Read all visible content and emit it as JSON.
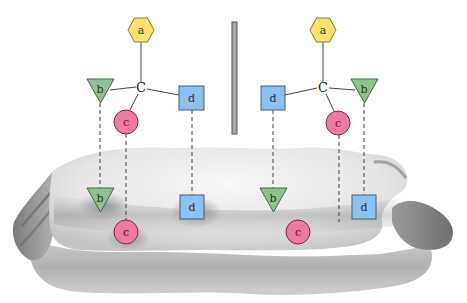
{
  "figure": {
    "divider": {
      "x": 232,
      "y": 22,
      "width": 5,
      "height": 112,
      "fill": "#a9a9ad",
      "stroke": "#555555"
    }
  },
  "colors": {
    "hexagon": "#f7e26b",
    "hexagon_stroke": "#8d7a2a",
    "triangle": "#8fc28f",
    "triangle_stroke": "#3e6b3e",
    "circle": "#ee7aa3",
    "circle_stroke": "#7c2d4a",
    "square": "#8cc1ee",
    "square_stroke": "#3a5f82",
    "surface_light": "#f2f2f2",
    "surface_dark": "#9b9b9b",
    "line": "#444444"
  },
  "left_molecule": {
    "center_label": "C",
    "a": {
      "label": "a",
      "shape": "hexagon",
      "cx": 141,
      "cy": 30
    },
    "b": {
      "label": "b",
      "shape": "triangle",
      "cx": 100,
      "cy": 89
    },
    "c": {
      "label": "c",
      "shape": "circle",
      "cx": 126,
      "cy": 122
    },
    "d": {
      "label": "d",
      "shape": "square",
      "cx": 191,
      "cy": 98
    }
  },
  "right_molecule": {
    "center_label": "C",
    "a": {
      "label": "a",
      "shape": "hexagon",
      "cx": 323,
      "cy": 30
    },
    "d": {
      "label": "d",
      "shape": "square",
      "cx": 273,
      "cy": 98
    },
    "b": {
      "label": "b",
      "shape": "triangle",
      "cx": 364,
      "cy": 89
    },
    "c": {
      "label": "c",
      "shape": "circle",
      "cx": 338,
      "cy": 123
    }
  },
  "surface_sites": {
    "left": [
      {
        "label": "b",
        "shape": "triangle",
        "cx": 100,
        "cy": 198
      },
      {
        "label": "c",
        "shape": "circle",
        "cx": 126,
        "cy": 232
      },
      {
        "label": "d",
        "shape": "square",
        "cx": 192,
        "cy": 207
      }
    ],
    "right": [
      {
        "label": "b",
        "shape": "triangle",
        "cx": 273,
        "cy": 198
      },
      {
        "label": "c",
        "shape": "circle",
        "cx": 298,
        "cy": 232
      },
      {
        "label": "d",
        "shape": "square",
        "cx": 364,
        "cy": 207
      }
    ]
  }
}
